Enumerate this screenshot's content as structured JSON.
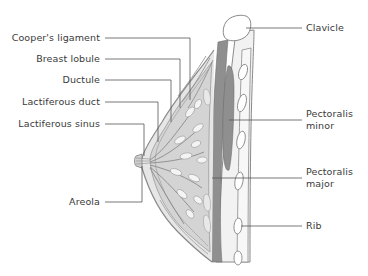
{
  "diagram": {
    "colors": {
      "outline": "#8a8a8a",
      "leader": "#555555",
      "muscle": "#8f8f8f",
      "tissue": "#d4d4d4",
      "fat_light": "#ececec",
      "bone": "#ffffff",
      "text": "#3a3a3a"
    },
    "labels_left": [
      {
        "id": "coopers-ligament",
        "text": "Cooper's ligament"
      },
      {
        "id": "breast-lobule",
        "text": "Breast lobule"
      },
      {
        "id": "ductule",
        "text": "Ductule"
      },
      {
        "id": "lactiferous-duct",
        "text": "Lactiferous duct"
      },
      {
        "id": "lactiferous-sinus",
        "text": "Lactiferous sinus"
      },
      {
        "id": "areola",
        "text": "Areola"
      }
    ],
    "labels_right": [
      {
        "id": "clavicle",
        "line1": "Clavicle",
        "line2": ""
      },
      {
        "id": "pectoralis-minor",
        "line1": "Pectoralis",
        "line2": "minor"
      },
      {
        "id": "pectoralis-major",
        "line1": "Pectoralis",
        "line2": "major"
      },
      {
        "id": "rib",
        "line1": "Rib",
        "line2": ""
      }
    ]
  }
}
